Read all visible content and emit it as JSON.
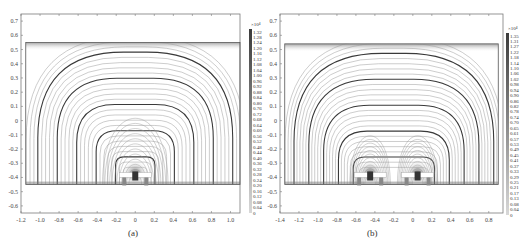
{
  "figure": {
    "panels": [
      {
        "id": "a",
        "caption": "(a)"
      },
      {
        "id": "b",
        "caption": "(b)"
      }
    ]
  },
  "chart_data": [
    {
      "type": "contour",
      "title": "",
      "caption": "(a)",
      "xlabel": "",
      "ylabel": "",
      "xlim": [
        -1.2,
        1.1
      ],
      "ylim": [
        -0.65,
        0.75
      ],
      "x_ticks": [
        "-1.2",
        "-1.0",
        "-0.8",
        "-0.6",
        "-0.4",
        "-0.2",
        "0",
        "0.2",
        "0.4",
        "0.6",
        "0.8",
        "1.0"
      ],
      "y_ticks": [
        "0.7",
        "0.6",
        "0.5",
        "0.4",
        "0.3",
        "0.2",
        "0.1",
        "0",
        "-0.1",
        "-0.2",
        "-0.3",
        "-0.4",
        "-0.5",
        "-0.6"
      ],
      "domain_box": {
        "x": [
          -1.15,
          1.1
        ],
        "y": [
          -0.45,
          0.55
        ]
      },
      "description": "Magnetic flux lines (streamlines) forming nested arches centered above a single magnet/coil assembly located near x=0, y=-0.4",
      "sources": [
        {
          "x": 0.0,
          "y": -0.4
        }
      ],
      "colorbar": {
        "exponent_label": "×10⁴",
        "ticks": [
          "1.32",
          "1.28",
          "1.24",
          "1.20",
          "1.16",
          "1.12",
          "1.08",
          "1.04",
          "1.00",
          "0.96",
          "0.92",
          "0.88",
          "0.84",
          "0.80",
          "0.76",
          "0.72",
          "0.68",
          "0.64",
          "0.60",
          "0.56",
          "0.52",
          "0.48",
          "0.44",
          "0.40",
          "0.36",
          "0.32",
          "0.28",
          "0.24",
          "0.20",
          "0.16",
          "0.12",
          "0.08",
          "0.04",
          "0"
        ],
        "range": [
          0,
          1.32
        ]
      },
      "grid": false
    },
    {
      "type": "contour",
      "title": "",
      "caption": "(b)",
      "xlabel": "",
      "ylabel": "",
      "xlim": [
        -1.4,
        0.95
      ],
      "ylim": [
        -0.65,
        0.75
      ],
      "x_ticks": [
        "-1.4",
        "-1.2",
        "-1.0",
        "-0.8",
        "-0.6",
        "-0.4",
        "-0.2",
        "0",
        "0.2",
        "0.4",
        "0.6",
        "0.8"
      ],
      "y_ticks": [
        "0.7",
        "0.6",
        "0.5",
        "0.4",
        "0.3",
        "0.2",
        "0.1",
        "0",
        "-0.1",
        "-0.2",
        "-0.3",
        "-0.4",
        "-0.5",
        "-0.6"
      ],
      "domain_box": {
        "x": [
          -1.35,
          0.9
        ],
        "y": [
          -0.45,
          0.54
        ]
      },
      "description": "Magnetic flux lines for a two-source configuration: outer nested arches spanning both assemblies and inner split lobes above each assembly near x=-0.45 and x=0.05, y=-0.4",
      "sources": [
        {
          "x": -0.45,
          "y": -0.4
        },
        {
          "x": 0.05,
          "y": -0.4
        }
      ],
      "colorbar": {
        "exponent_label": "×10⁴",
        "ticks": [
          "1.35",
          "1.31",
          "1.27",
          "1.22",
          "1.18",
          "1.14",
          "1.10",
          "1.06",
          "1.02",
          "0.98",
          "0.94",
          "0.90",
          "0.86",
          "0.82",
          "0.78",
          "0.74",
          "0.70",
          "0.65",
          "0.61",
          "0.57",
          "0.53",
          "0.49",
          "0.45",
          "0.41",
          "0.37",
          "0.33",
          "0.29",
          "0.25",
          "0.21",
          "0.17",
          "0.13",
          "0.08",
          "0.04",
          "0"
        ],
        "range": [
          0,
          1.35
        ]
      },
      "grid": false
    }
  ],
  "colors": {
    "axis": "#7a7a7a",
    "line_dark": "#3a3a3a",
    "line_light": "#9a9a9a",
    "colorbar_top": "#3c3c3c",
    "colorbar_bottom": "#d8d8d8"
  }
}
